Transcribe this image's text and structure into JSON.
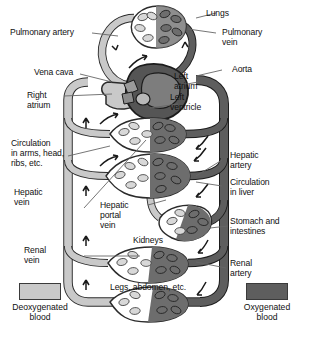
{
  "diagram": {
    "type": "biological-schematic",
    "colors": {
      "deoxygenated": "#c9c9c9",
      "oxygenated": "#5e5e5e",
      "outline": "#2b2b2b",
      "background": "#ffffff",
      "leader_line": "#555555"
    },
    "labels": {
      "pulmonary_artery": "Pulmonary artery",
      "lungs": "Lungs",
      "pulmonary_vein": "Pulmonary\nvein",
      "vena_cava": "Vena cava",
      "aorta": "Aorta",
      "right_atrium": "Right\natrium",
      "left_atrium": "Left\natrium",
      "left_ventricle": "Left\nventricle",
      "circulation_arms": "Circulation\nin arms, head,\nribs, etc.",
      "hepatic_artery": "Hepatic\nartery",
      "hepatic_vein": "Hepatic\nvein",
      "circulation_liver": "Circulation\nin liver",
      "hepatic_portal_vein": "Hepatic\nportal\nvein",
      "stomach_intestines": "Stomach and\nintestines",
      "kidneys": "Kidneys",
      "renal_vein": "Renal\nvein",
      "renal_artery": "Renal\nartery",
      "legs_abdomen": "Legs, abdomen, etc."
    },
    "legend": [
      {
        "key": "deoxygenated",
        "label": "Deoxygenated\nblood",
        "color": "#c9c9c9"
      },
      {
        "key": "oxygenated",
        "label": "Oxygenated\nblood",
        "color": "#5e5e5e"
      }
    ],
    "organs": [
      {
        "name": "lungs",
        "label": "Lungs"
      },
      {
        "name": "upper-body",
        "label": "Circulation in arms, head, ribs, etc."
      },
      {
        "name": "liver",
        "label": "Circulation in liver"
      },
      {
        "name": "gut",
        "label": "Stomach and intestines"
      },
      {
        "name": "kidneys",
        "label": "Kidneys"
      },
      {
        "name": "lower-body",
        "label": "Legs, abdomen, etc."
      }
    ]
  }
}
